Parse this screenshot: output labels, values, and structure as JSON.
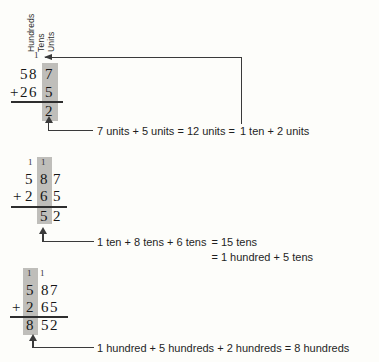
{
  "colors": {
    "background": "#fdfdfa",
    "ink": "#161616",
    "annotation_ink": "#1f1f1f",
    "column_highlight": "#bfbeba",
    "arrow_line": "#3a3a3a"
  },
  "column_labels": {
    "hundreds": "Hundreds",
    "tens": "Tens",
    "units": "Units"
  },
  "step_units": {
    "carry_over_tens": "1",
    "addend1_prefix": "58",
    "addend1_unit": "7",
    "plus_sign": "+",
    "addend2_prefix": "26",
    "addend2_unit": "5",
    "result_unit": "2",
    "annotation_prefix": "7 units + 5 units = 12 units =",
    "annotation_target": "1 ten + 2 units"
  },
  "step_tens": {
    "carry_over_hundreds": "1",
    "carry_over_tens": "1",
    "addend1_hundreds": "5",
    "addend1_tens": "8",
    "addend1_units": "7",
    "plus_sign": "+",
    "addend2_hundreds": "2",
    "addend2_tens": "6",
    "addend2_units": "5",
    "result_tens": "5",
    "result_units": "2",
    "annotation_lhs": "1 ten + 8 tens + 6 tens",
    "annotation_eq1": "= 15 tens",
    "annotation_eq2": "= 1 hundred + 5 tens"
  },
  "step_hundreds": {
    "carry_over_hundreds": "1",
    "carry_over_tens": "1",
    "addend1_hundred": "5",
    "addend1_rest": "87",
    "plus_sign": "+",
    "addend2_hundred": "2",
    "addend2_rest": "65",
    "result_hundred": "8",
    "result_rest": "52",
    "annotation": "1 hundred + 5 hundreds + 2 hundreds = 8 hundreds"
  }
}
